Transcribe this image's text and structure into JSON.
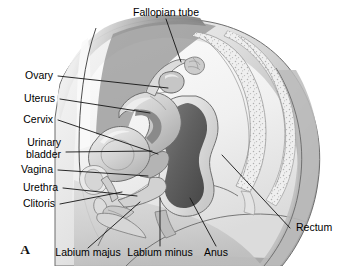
{
  "figure": {
    "panel_letter": "A",
    "title_hidden": "Sagittal section of the female pelvis"
  },
  "labels": {
    "fallopian_tube": "Fallopian tube",
    "ovary": "Ovary",
    "uterus": "Uterus",
    "cervix": "Cervix",
    "urinary_bladder_line1": "Urinary",
    "urinary_bladder_line2": "bladder",
    "vagina": "Vagina",
    "urethra": "Urethra",
    "clitoris": "Clitoris",
    "labium_majus": "Labium majus",
    "labium_minus": "Labium minus",
    "anus": "Anus",
    "rectum": "Rectum"
  },
  "colors": {
    "background": "#ffffff",
    "text": "#000000",
    "leader_line": "#141414",
    "outline": "#5d5d5d",
    "body_light": "#f2f2f2",
    "body_mid": "#dcdcdc",
    "body_shade": "#c8c8c8",
    "body_dark": "#9a9a9a",
    "abdominal_dark": "#8d8d8d",
    "organ_light": "#e6e6e6",
    "organ_mid": "#c0c0c0",
    "organ_dark": "#8f8f8f",
    "lumen_dark": "#6b6b6b",
    "lumen_darkest": "#4f4f4f",
    "bone_fill": "#ededed",
    "bone_stipple": "#b5b5b5"
  }
}
